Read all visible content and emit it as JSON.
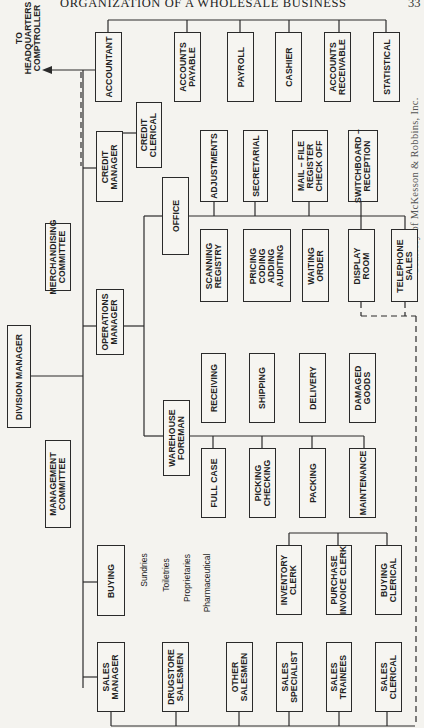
{
  "page": {
    "header": "ORGANIZATION OF A WHOLESALE BUSINESS",
    "page_number": "33",
    "credit": "Courtesy of McKesson & Robbins, Inc."
  },
  "external": {
    "hq_label": "TO\nHEADQUARTERS\nCOMPTROLLER"
  },
  "chart": {
    "top": {
      "division_manager": "DIVISION MANAGER",
      "management_committee": "MANAGEMENT\nCOMMITTEE",
      "merchandising_committee": "MERCHANDISING\nCOMMITTEE"
    },
    "accounting": {
      "accountant": "ACCOUNTANT",
      "units": [
        "ACCOUNTS\nPAYABLE",
        "PAYROLL",
        "CASHIER",
        "ACCOUNTS\nRECEIVABLE",
        "STATISTICAL"
      ]
    },
    "credit": {
      "manager": "CREDIT\nMANAGER",
      "clerical": "CREDIT\nCLERICAL"
    },
    "operations": {
      "manager": "OPERATIONS\nMANAGER",
      "office": "OFFICE",
      "office_upper": [
        "ADJUSTMENTS",
        "SECRETARIAL",
        "MAIL – FILE\nREGISTER\nCHECK OFF",
        "SWITCHBOARD –\nRECEPTION"
      ],
      "office_lower": [
        "SCANNING\nREGISTRY",
        "PRICING\nCODING\nADDING\nAUDITING",
        "WAITING\nORDER",
        "DISPLAY\nROOM",
        "TELEPHONE\nSALES"
      ],
      "warehouse_foreman": "WAREHOUSE\nFOREMAN",
      "warehouse_upper": [
        "RECEIVING",
        "SHIPPING",
        "DELIVERY",
        "DAMAGED\nGOODS"
      ],
      "warehouse_lower": [
        "FULL CASE",
        "PICKING\nCHECKING",
        "PACKING",
        "MAINTENANCE"
      ]
    },
    "buying": {
      "label": "BUYING",
      "categories": [
        "Sundries",
        "Toiletries",
        "Proprietaries",
        "Pharmaceutical"
      ],
      "units": [
        "INVENTORY\nCLERK",
        "PURCHASE\nINVOICE CLERK",
        "BUYING\nCLERICAL"
      ]
    },
    "sales": {
      "manager": "SALES\nMANAGER",
      "units": [
        "DRUGSTORE\nSALESMEN",
        "OTHER\nSALESMEN",
        "SALES\nSPECIALIST",
        "SALES\nTRAINEES",
        "SALES\nCLERICAL"
      ]
    }
  },
  "colors": {
    "paper": "#f4f3ef",
    "ink": "#2a2a2a"
  }
}
